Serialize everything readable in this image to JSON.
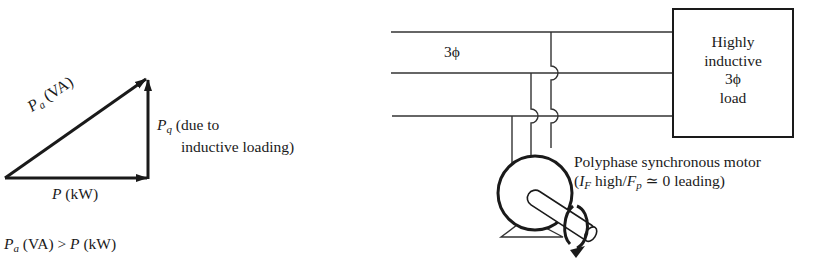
{
  "power_triangle": {
    "hypotenuse_label": {
      "symbol": "P",
      "sub": "a",
      "unit": " (VA)"
    },
    "vertical_label": {
      "symbol": "P",
      "sub": "q",
      "line1": " (due to",
      "line2": "inductive loading)"
    },
    "horizontal_label": {
      "symbol": "P",
      "unit": " (kW)"
    },
    "inequality": {
      "left_symbol": "P",
      "left_sub": "a",
      "left_unit": " (VA)",
      "op": " > ",
      "right_symbol": "P",
      "right_unit": " (kW)"
    }
  },
  "circuit": {
    "bus_label": "3ϕ",
    "load_box": {
      "line1": "Highly",
      "line2": "inductive",
      "line3": "3ϕ",
      "line4": "load"
    },
    "motor_label": {
      "line1": "Polyphase synchronous motor",
      "line2_open": "(",
      "line2_sym1": "I",
      "line2_sub1": "F",
      "line2_mid": " high/",
      "line2_sym2": "F",
      "line2_sub2": "p",
      "line2_end": " ≃ 0 leading)"
    }
  },
  "colors": {
    "ink": "#1a1a1a",
    "background": "#ffffff"
  }
}
